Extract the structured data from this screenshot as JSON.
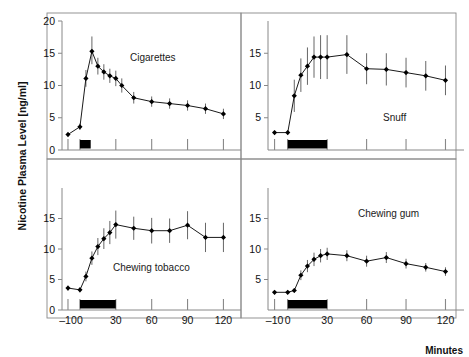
{
  "figure": {
    "ylabel": "Nicotine Plasma Level [ng/ml]",
    "xlabel": "Minutes"
  },
  "chart_data": {
    "type": "line",
    "title": "",
    "xlabel": "Minutes",
    "ylabel": "Nicotine Plasma Level [ng/ml]",
    "xlim": [
      -15,
      128
    ],
    "xticks": [
      -10,
      0,
      30,
      60,
      90,
      120
    ],
    "xticklabels": [
      "–10",
      "0",
      "30",
      "60",
      "90",
      "120"
    ],
    "grid": false,
    "legend": "none",
    "panels": [
      {
        "name": "Cigarettes",
        "label": "Cigarettes",
        "position": "top-left",
        "ylim": [
          0,
          20
        ],
        "yticks": [
          0,
          5,
          10,
          15,
          20
        ],
        "yticklabels": [
          "0",
          "5",
          "10",
          "15",
          "20"
        ],
        "exposure_bar": {
          "start": 0,
          "end": 9
        },
        "x": [
          -10,
          0,
          5,
          10,
          15,
          20,
          25,
          30,
          35,
          45,
          60,
          75,
          90,
          105,
          120
        ],
        "values": [
          2.4,
          3.6,
          11.1,
          15.3,
          13.0,
          12.1,
          11.5,
          11.1,
          10.0,
          8.1,
          7.5,
          7.2,
          6.9,
          6.4,
          5.6
        ],
        "err_lower": [
          0.4,
          0.5,
          1.3,
          2.0,
          1.3,
          1.2,
          1.1,
          1.2,
          1.1,
          0.9,
          0.8,
          0.8,
          0.8,
          0.8,
          0.8
        ],
        "err_upper": [
          0.4,
          0.5,
          1.3,
          2.3,
          1.3,
          1.2,
          1.1,
          1.2,
          1.1,
          0.9,
          0.8,
          0.8,
          0.8,
          0.8,
          0.8
        ]
      },
      {
        "name": "Snuff",
        "label": "Snuff",
        "position": "top-right",
        "ylim": [
          0,
          20
        ],
        "yticks": [
          5,
          10,
          15
        ],
        "yticklabels": [
          "5",
          "10",
          "15"
        ],
        "exposure_bar": {
          "start": 0,
          "end": 30
        },
        "x": [
          -10,
          0,
          5,
          10,
          15,
          20,
          25,
          30,
          45,
          60,
          75,
          90,
          105,
          120
        ],
        "values": [
          2.7,
          2.7,
          8.4,
          11.6,
          13.0,
          14.4,
          14.4,
          14.4,
          14.8,
          12.6,
          12.5,
          12.0,
          11.5,
          10.8
        ],
        "err_lower": [
          0.3,
          0.3,
          2.5,
          2.6,
          2.9,
          3.2,
          3.4,
          3.4,
          3.0,
          2.4,
          2.5,
          2.3,
          2.3,
          2.3
        ],
        "err_upper": [
          0.3,
          0.3,
          2.5,
          2.6,
          2.9,
          3.2,
          3.4,
          3.4,
          3.0,
          2.4,
          2.5,
          2.3,
          2.3,
          2.3
        ]
      },
      {
        "name": "Chewing tobacco",
        "label": "Chewing tobacco",
        "position": "bottom-left",
        "ylim": [
          0,
          20
        ],
        "yticks": [
          0,
          5,
          10,
          15
        ],
        "yticklabels": [
          "0",
          "5",
          "10",
          "15"
        ],
        "exposure_bar": {
          "start": 0,
          "end": 30
        },
        "x": [
          -10,
          0,
          5,
          10,
          15,
          20,
          25,
          30,
          45,
          60,
          75,
          90,
          105,
          120
        ],
        "values": [
          3.6,
          3.3,
          5.5,
          8.5,
          10.4,
          11.7,
          12.7,
          14.0,
          13.4,
          13.0,
          13.0,
          13.9,
          11.9,
          11.9
        ],
        "err_lower": [
          0.4,
          0.4,
          0.8,
          1.1,
          1.4,
          1.7,
          1.9,
          2.3,
          1.9,
          2.1,
          2.0,
          2.3,
          2.4,
          2.4
        ],
        "err_upper": [
          0.4,
          0.4,
          0.8,
          1.1,
          1.4,
          1.7,
          1.9,
          2.3,
          1.9,
          2.1,
          2.0,
          2.3,
          2.4,
          2.4
        ]
      },
      {
        "name": "Chewing gum",
        "label": "Chewing gum",
        "position": "bottom-right",
        "ylim": [
          0,
          20
        ],
        "yticks": [
          5,
          10,
          15
        ],
        "yticklabels": [
          "5",
          "10",
          "15"
        ],
        "exposure_bar": {
          "start": 0,
          "end": 30
        },
        "x": [
          -10,
          0,
          5,
          10,
          15,
          20,
          25,
          30,
          45,
          60,
          75,
          90,
          105,
          120
        ],
        "values": [
          2.9,
          2.9,
          3.2,
          5.7,
          7.2,
          8.3,
          8.9,
          9.2,
          8.9,
          8.0,
          8.6,
          7.6,
          7.0,
          6.3
        ],
        "err_lower": [
          0.3,
          0.3,
          0.4,
          0.8,
          1.0,
          1.1,
          1.1,
          1.0,
          0.9,
          0.9,
          0.9,
          0.8,
          0.7,
          0.7
        ],
        "err_upper": [
          0.3,
          0.3,
          0.4,
          0.8,
          1.0,
          1.1,
          1.1,
          1.0,
          0.9,
          0.9,
          0.9,
          0.8,
          0.7,
          0.7
        ]
      }
    ],
    "colors": {
      "line": "#1a1a1a",
      "marker": "#000000",
      "error": "#555555",
      "axis": "#888888",
      "bar": "#000000"
    }
  }
}
